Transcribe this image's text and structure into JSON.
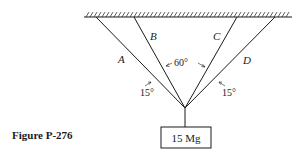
{
  "figure": {
    "caption": "Figure P-276",
    "colors": {
      "line": "#1a1a1a",
      "background": "#ffffff"
    }
  },
  "cables": [
    {
      "label": "A"
    },
    {
      "label": "B"
    },
    {
      "label": "C"
    },
    {
      "label": "D"
    }
  ],
  "angles": {
    "between_b_c": "60°",
    "left_a_b": "15°",
    "right_c_d": "15°"
  },
  "load": {
    "label": "15 Mg"
  }
}
